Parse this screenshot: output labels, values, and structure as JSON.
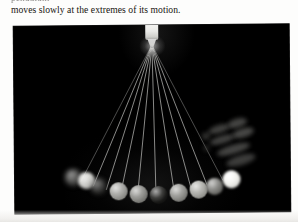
{
  "page": {
    "background_color": "#fdfdfc",
    "text_color": "#17140f"
  },
  "body_text": {
    "partial_line_above": "pendulum",
    "caption_line": "moves slowly at the extremes of its motion."
  },
  "photo": {
    "name": "pendulum-multiple-exposure-photograph",
    "background_color": "#000000",
    "description": "Multiple-exposure photograph of a swinging pendulum bob suspended from a single pivot, showing many string positions fanning out and a row of bob images along an arc.",
    "pivot": {
      "label": "pivot-support-block",
      "color": "#f4f4f2",
      "x_pct": 50.2,
      "y_pct": 0
    },
    "strings": {
      "count": 10,
      "color": "#c9c9c5",
      "origin_x_pct": 50.2,
      "origin_y_pct": 10.5,
      "end_x_pcts": [
        24.0,
        28.5,
        33.2,
        38.5,
        44.6,
        51.2,
        57.8,
        64.0,
        69.8,
        75.5
      ],
      "end_y_pcts": [
        83.0,
        85.5,
        87.5,
        89.0,
        89.8,
        89.5,
        88.6,
        87.4,
        85.6,
        83.0
      ]
    },
    "balls": [
      {
        "label": "bob-1-blurred-left-extreme",
        "x_pct": 21.5,
        "y_pct": 81.0,
        "d_px": 17,
        "color": "#585856",
        "blur_px": 2.6,
        "opacity": 0.85
      },
      {
        "label": "bob-2-blurred-highlight",
        "x_pct": 26.0,
        "y_pct": 82.5,
        "d_px": 17,
        "color": "#d7d7d3",
        "blur_px": 1.6,
        "opacity": 0.95
      },
      {
        "label": "bob-3-blurred",
        "x_pct": 30.5,
        "y_pct": 85.5,
        "d_px": 16,
        "color": "#3e3e3c",
        "blur_px": 2.4,
        "opacity": 0.85
      },
      {
        "label": "bob-4",
        "x_pct": 37.5,
        "y_pct": 88.5,
        "d_px": 18,
        "color": "#9d9d99",
        "blur_px": 0.5,
        "opacity": 1
      },
      {
        "label": "bob-5",
        "x_pct": 45.0,
        "y_pct": 90.0,
        "d_px": 18,
        "color": "#8a8a86",
        "blur_px": 0.5,
        "opacity": 1
      },
      {
        "label": "bob-6-dark",
        "x_pct": 52.0,
        "y_pct": 90.5,
        "d_px": 18,
        "color": "#232321",
        "blur_px": 0.6,
        "opacity": 1
      },
      {
        "label": "bob-7",
        "x_pct": 59.5,
        "y_pct": 89.5,
        "d_px": 18,
        "color": "#8f8f8b",
        "blur_px": 0.5,
        "opacity": 1
      },
      {
        "label": "bob-8",
        "x_pct": 66.5,
        "y_pct": 88.0,
        "d_px": 18,
        "color": "#a7a7a2",
        "blur_px": 0.5,
        "opacity": 1
      },
      {
        "label": "bob-9",
        "x_pct": 72.5,
        "y_pct": 86.0,
        "d_px": 17,
        "color": "#7b7b77",
        "blur_px": 0.9,
        "opacity": 1
      },
      {
        "label": "bob-10-bright-right-extreme",
        "x_pct": 78.5,
        "y_pct": 82.5,
        "d_px": 18,
        "color": "#efefeb",
        "blur_px": 0.9,
        "opacity": 1
      }
    ],
    "hand": {
      "label": "blurred-hand-right",
      "color": "#4c4c4a",
      "x_pct": 80,
      "y_pct": 66
    }
  }
}
